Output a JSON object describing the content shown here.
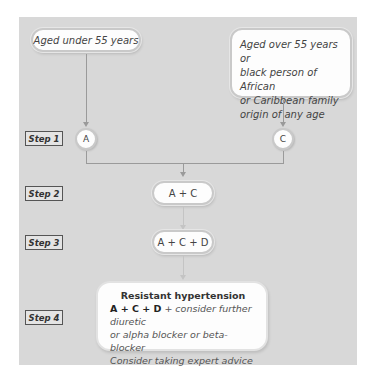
{
  "diagram": {
    "groups": {
      "left": "Aged under 55 years",
      "right_lines": [
        "Aged over 55 years or",
        "black person of African",
        "or Caribbean family",
        "origin of any age"
      ]
    },
    "steps": [
      {
        "label": "Step 1",
        "nodes": [
          "A",
          "C"
        ]
      },
      {
        "label": "Step 2",
        "nodes": [
          "A + C"
        ]
      },
      {
        "label": "Step 3",
        "nodes": [
          "A + C + D"
        ]
      },
      {
        "label": "Step 4",
        "nodes": [
          "Resistant hypertension"
        ]
      }
    ],
    "final": {
      "title": "Resistant hypertension",
      "drug": "A + C + D",
      "line1_rest": "+ consider further diuretic",
      "line2": "or alpha blocker or beta-blocker",
      "line3": "Consider taking expert advice"
    },
    "colors": {
      "panel": "#d8d8d8",
      "box": "#fdfdfd",
      "connector": "#9a9a9a"
    }
  }
}
